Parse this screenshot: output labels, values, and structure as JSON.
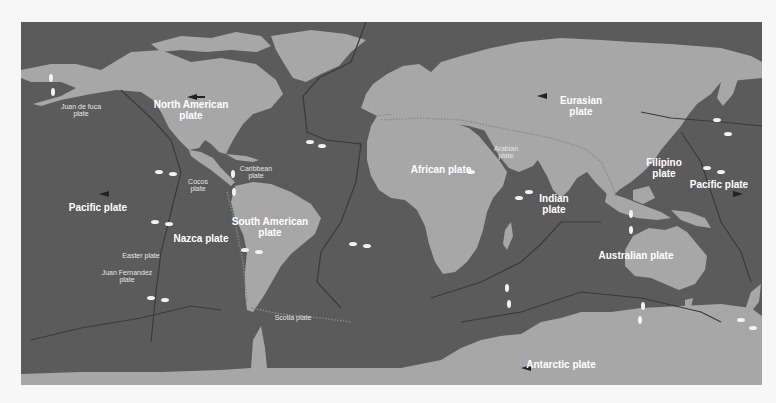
{
  "map": {
    "title": "Tectonic plates",
    "colors": {
      "ocean": "#5b5b5b",
      "land": "#a7a7a7",
      "label": "#ffffff",
      "boundary": "#3c3c3c",
      "arrow_dark": "#222222",
      "arrow_light": "#f2f2f2"
    },
    "plates_major": [
      {
        "id": "north-american",
        "line1": "North American",
        "line2": "plate",
        "x": 170,
        "y": 88
      },
      {
        "id": "eurasian",
        "line1": "Eurasian",
        "line2": "plate",
        "x": 560,
        "y": 84
      },
      {
        "id": "african",
        "line1": "African plate",
        "line2": "",
        "x": 420,
        "y": 148
      },
      {
        "id": "indian",
        "line1": "Indian",
        "line2": "plate",
        "x": 533,
        "y": 182
      },
      {
        "id": "filipino",
        "line1": "Filipino",
        "line2": "plate",
        "x": 643,
        "y": 146
      },
      {
        "id": "pacific-east",
        "line1": "Pacific plate",
        "line2": "",
        "x": 698,
        "y": 163
      },
      {
        "id": "pacific-west",
        "line1": "Pacific plate",
        "line2": "",
        "x": 77,
        "y": 186
      },
      {
        "id": "south-american",
        "line1": "South American",
        "line2": "plate",
        "x": 249,
        "y": 205
      },
      {
        "id": "nazca",
        "line1": "Nazca plate",
        "line2": "",
        "x": 180,
        "y": 217
      },
      {
        "id": "australian",
        "line1": "Australian plate",
        "line2": "",
        "x": 615,
        "y": 234
      },
      {
        "id": "antarctic",
        "line1": "Antarctic plate",
        "line2": "",
        "x": 540,
        "y": 343
      }
    ],
    "plates_minor": [
      {
        "id": "juan-de-fuca",
        "line1": "Juan de fuca",
        "line2": "plate",
        "x": 60,
        "y": 88
      },
      {
        "id": "caribbean",
        "line1": "Caribbean",
        "line2": "plate",
        "x": 235,
        "y": 150
      },
      {
        "id": "cocos",
        "line1": "Cocos",
        "line2": "plate",
        "x": 177,
        "y": 163
      },
      {
        "id": "arabian",
        "line1": "Arabian",
        "line2": "plate",
        "x": 485,
        "y": 130
      },
      {
        "id": "easter",
        "line1": "Easter plate",
        "line2": "",
        "x": 120,
        "y": 234
      },
      {
        "id": "juan-fernandez",
        "line1": "Juan Fernandez",
        "line2": "plate",
        "x": 106,
        "y": 254
      },
      {
        "id": "scotia",
        "line1": "Scotia plate",
        "line2": "",
        "x": 272,
        "y": 296
      }
    ]
  }
}
